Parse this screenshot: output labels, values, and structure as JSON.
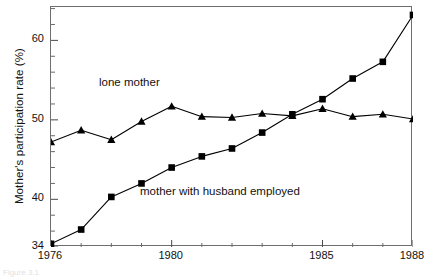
{
  "figure": {
    "caption_partial": "Figure 3.1"
  },
  "chart_data": {
    "type": "line",
    "title": "",
    "subtitle": "",
    "xlabel": "",
    "ylabel": "Mother's participation rate (%)",
    "x": [
      1976,
      1977,
      1978,
      1979,
      1980,
      1981,
      1982,
      1983,
      1984,
      1985,
      1986,
      1987,
      1988
    ],
    "xticklabels_major": [
      "1976",
      "1980",
      "1985",
      "1988"
    ],
    "xtick_major_values": [
      1976,
      1980,
      1985,
      1988
    ],
    "xlim": [
      1976,
      1988
    ],
    "ylim": [
      34,
      64.2
    ],
    "yticklabels": [
      "34",
      "40",
      "50",
      "60"
    ],
    "ytick_values": [
      34,
      40,
      50,
      60
    ],
    "yminor_step": 2,
    "grid": false,
    "legend_position": "inline-annotations",
    "series": [
      {
        "name": "lone mother",
        "marker": "triangle",
        "color": "#000000",
        "values": [
          47.2,
          48.7,
          47.5,
          49.8,
          51.7,
          50.4,
          50.3,
          50.8,
          50.5,
          51.4,
          50.4,
          50.7,
          50.1
        ]
      },
      {
        "name": "mother with husband employed",
        "marker": "square",
        "color": "#000000",
        "values": [
          34.4,
          36.2,
          40.3,
          42.0,
          44.0,
          45.4,
          46.4,
          48.4,
          50.7,
          52.6,
          55.2,
          57.3,
          63.2
        ]
      }
    ],
    "annotations": [
      {
        "text": "lone mother",
        "x": 1977.6,
        "y": 55.0
      },
      {
        "text": "mother with husband employed",
        "x": 1979.1,
        "y": 41.2
      }
    ]
  }
}
